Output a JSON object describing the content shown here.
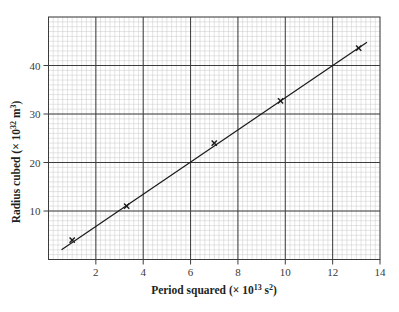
{
  "chart_data": {
    "type": "scatter",
    "title": "",
    "xlabel": "Period squared (× 10¹³ s²)",
    "ylabel": "Radius cubed (× 10³² m³)",
    "xlabel_parts": {
      "main": "Period squared (× 10",
      "sup1": "13",
      "mid": " s",
      "sup2": "2",
      "end": ")"
    },
    "ylabel_parts": {
      "main": "Radius cubed (× 10",
      "sup1": "32",
      "mid": " m",
      "sup2": "3",
      "end": ")"
    },
    "xlim": [
      0,
      14
    ],
    "ylim": [
      0,
      50
    ],
    "x_ticks": [
      2,
      4,
      6,
      8,
      10,
      12,
      14
    ],
    "y_ticks": [
      10,
      20,
      30,
      40
    ],
    "grid": {
      "major_x_step": 2,
      "minor_x_step": 0.2,
      "major_y_step": 10,
      "minor_y_step": 1
    },
    "marker": "x",
    "series": [
      {
        "name": "measurements",
        "x": [
          1.0,
          3.3,
          7.0,
          9.8,
          13.1
        ],
        "y": [
          4.0,
          11.0,
          24.0,
          32.7,
          43.6
        ]
      }
    ],
    "best_fit_line": {
      "x": [
        0.55,
        13.45
      ],
      "y": [
        2.0,
        44.8
      ]
    },
    "legend": null
  },
  "colors": {
    "minor_grid": "#c8c8c8",
    "major_grid": "#3c3c3c",
    "frame": "#3c3c3c",
    "line": "#1a1a1a",
    "marker": "#1a1a1a"
  }
}
